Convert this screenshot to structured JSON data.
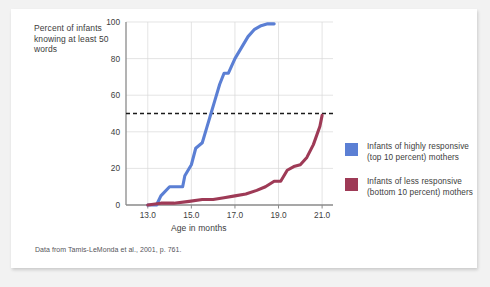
{
  "figure": {
    "y_axis_title": "Percent of infants knowing at least 50 words",
    "x_axis_title": "Age in months",
    "source_note": "Data from Tamis-LeMonda et al., 2001, p. 761."
  },
  "legend": {
    "position": "right",
    "entries": [
      {
        "label": "Infants of highly responsive (top 10 percent) mothers",
        "color": "#5b7fd4",
        "icon": "color-swatch"
      },
      {
        "label": "Infants of less responsive (bottom 10 percent) mothers",
        "color": "#9e3a56",
        "icon": "color-swatch"
      }
    ]
  },
  "chart_data": {
    "type": "line",
    "title": "",
    "xlabel": "Age in months",
    "ylabel": "Percent of infants knowing at least 50 words",
    "xlim": [
      12.0,
      21.5
    ],
    "ylim": [
      0,
      100
    ],
    "xticks": [
      "13.0",
      "15.0",
      "17.0",
      "19.0",
      "21.0"
    ],
    "xtick_values": [
      13.0,
      15.0,
      17.0,
      19.0,
      21.0
    ],
    "yticks": [
      "0",
      "20",
      "40",
      "60",
      "80",
      "100"
    ],
    "ytick_values": [
      0,
      20,
      40,
      60,
      80,
      100
    ],
    "grid": true,
    "reference_line": {
      "y": 50,
      "style": "dashed",
      "color": "#1a1a1a"
    },
    "series": [
      {
        "name": "Infants of highly responsive (top 10 percent) mothers",
        "color": "#5b7fd4",
        "x": [
          13.0,
          13.4,
          13.6,
          14.0,
          14.2,
          14.6,
          14.7,
          15.0,
          15.2,
          15.5,
          15.7,
          15.9,
          16.1,
          16.3,
          16.5,
          16.7,
          17.0,
          17.3,
          17.6,
          17.9,
          18.2,
          18.5,
          18.8
        ],
        "y": [
          0,
          0,
          5,
          10,
          10,
          10,
          16,
          22,
          31,
          34,
          42,
          50,
          58,
          66,
          72,
          72,
          80,
          86,
          92,
          96,
          98,
          99,
          99
        ]
      },
      {
        "name": "Infants of less responsive (bottom 10 percent) mothers",
        "color": "#9e3a56",
        "x": [
          13.0,
          13.6,
          14.2,
          14.9,
          15.5,
          16.0,
          16.5,
          17.0,
          17.5,
          18.0,
          18.4,
          18.8,
          19.1,
          19.4,
          19.7,
          20.0,
          20.3,
          20.6,
          20.9,
          21.0
        ],
        "y": [
          0,
          1,
          1,
          2,
          3,
          3,
          4,
          5,
          6,
          8,
          10,
          13,
          13,
          19,
          21,
          22,
          26,
          33,
          43,
          49
        ]
      }
    ]
  }
}
